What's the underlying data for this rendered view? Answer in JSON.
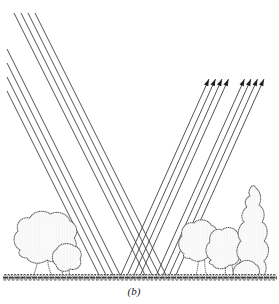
{
  "figure": {
    "caption_label": "(b)",
    "colors": {
      "ray": "#3f3f3f",
      "arrow": "#1e1e1e",
      "outline": "#606060",
      "ground": "#3a3a3a",
      "background": "#ffffff"
    },
    "incident_rays": [
      {
        "x1": 7,
        "y1": 91,
        "x2": 100,
        "y2": 277
      },
      {
        "x1": 7,
        "y1": 77,
        "x2": 107,
        "y2": 277
      },
      {
        "x1": 7,
        "y1": 63,
        "x2": 114,
        "y2": 277
      },
      {
        "x1": 7,
        "y1": 49,
        "x2": 121,
        "y2": 277
      },
      {
        "x1": 14,
        "y1": 13,
        "x2": 146,
        "y2": 277
      },
      {
        "x1": 21,
        "y1": 13,
        "x2": 153,
        "y2": 277
      },
      {
        "x1": 28,
        "y1": 13,
        "x2": 160,
        "y2": 277
      },
      {
        "x1": 35,
        "y1": 13,
        "x2": 167,
        "y2": 277
      }
    ],
    "reflected_rays": [
      {
        "x1": 120,
        "y1": 277,
        "x2": 209,
        "y2": 79
      },
      {
        "x1": 126.5,
        "y1": 277,
        "x2": 215.5,
        "y2": 79
      },
      {
        "x1": 133,
        "y1": 277,
        "x2": 222,
        "y2": 79
      },
      {
        "x1": 139.5,
        "y1": 277,
        "x2": 228.5,
        "y2": 79
      },
      {
        "x1": 155.5,
        "y1": 277,
        "x2": 244.5,
        "y2": 79
      },
      {
        "x1": 162,
        "y1": 277,
        "x2": 251,
        "y2": 79
      },
      {
        "x1": 168.5,
        "y1": 277,
        "x2": 257.5,
        "y2": 79
      },
      {
        "x1": 175,
        "y1": 277,
        "x2": 264,
        "y2": 79
      }
    ],
    "arrowhead": {
      "length": 7,
      "half_width": 2.3
    },
    "ray_stroke_width": 0.9
  }
}
